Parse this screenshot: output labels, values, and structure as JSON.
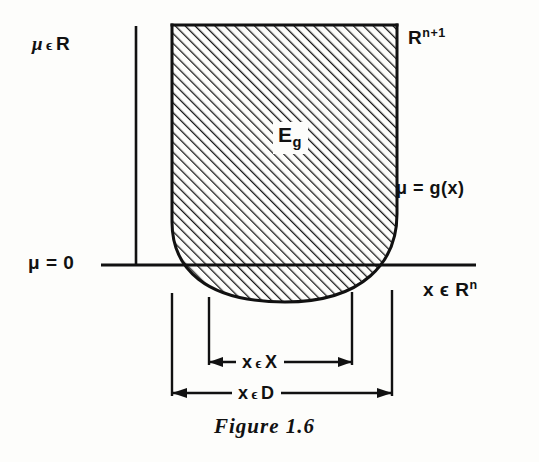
{
  "figure": {
    "caption": "Figure 1.6",
    "axes": {
      "vertical_axis_label": "μ ϵ R",
      "horizontal_axis_label": "x ϵ R",
      "horizontal_axis_label_sup": "n",
      "origin_level_label": "μ = 0"
    },
    "region": {
      "ambient_space_label": "R",
      "ambient_space_sup": "n+1",
      "epigraph_label": "E",
      "epigraph_sub": "g",
      "boundary_curve_label": "μ = g(x)"
    },
    "dimensions": [
      {
        "name": "x-in-X",
        "label_head": "x",
        "label_member": "ϵ",
        "label_set": "X",
        "left_tick_x": 209,
        "right_tick_x": 352,
        "line_y": 362
      },
      {
        "name": "x-in-D",
        "label_head": "x",
        "label_member": "ϵ",
        "label_set": "D",
        "left_tick_x": 172,
        "right_tick_x": 392,
        "line_y": 393
      }
    ],
    "colors": {
      "ink": "#111111",
      "paper": "#fdfdfb",
      "hatch": "#1a1a1a"
    }
  }
}
